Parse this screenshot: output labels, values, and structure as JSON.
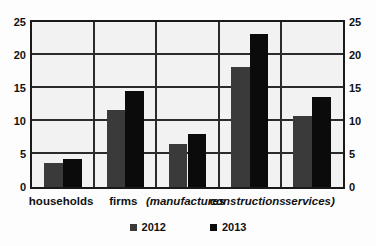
{
  "chart_data": {
    "type": "bar",
    "title": "",
    "subtitle": "",
    "xlabel": "",
    "ylabel": "",
    "ylim": [
      0,
      25
    ],
    "yticks": [
      0,
      5,
      10,
      15,
      20,
      25
    ],
    "grid": true,
    "dual_y_axis": true,
    "legend_position": "bottom",
    "categories": [
      "households",
      "firms",
      "(manufactures",
      "constructions",
      "services)"
    ],
    "series": [
      {
        "name": "2012",
        "color": "#3a3a3a",
        "values": [
          3.6,
          11.7,
          6.5,
          18.2,
          10.7
        ]
      },
      {
        "name": "2013",
        "color": "#0b0b0b",
        "values": [
          4.2,
          14.5,
          8.0,
          23.2,
          13.6
        ]
      }
    ]
  },
  "axes": {
    "left": {
      "name": "left-y-axis",
      "ticks": [
        "25",
        "20",
        "15",
        "10",
        "5",
        "0"
      ]
    },
    "right": {
      "name": "right-y-axis",
      "ticks": [
        "25",
        "20",
        "15",
        "10",
        "5",
        "0"
      ]
    }
  },
  "category_labels": [
    {
      "text": "households",
      "italic": false
    },
    {
      "text": "firms",
      "italic": false
    },
    {
      "text": "(manufactures",
      "italic": true
    },
    {
      "text": "constructions",
      "italic": true
    },
    {
      "text": "services)",
      "italic": true
    }
  ],
  "legend": {
    "entries": [
      {
        "label": "2012",
        "color": "#3a3a3a"
      },
      {
        "label": "2013",
        "color": "#0b0b0b"
      }
    ]
  },
  "colors": {
    "series_2012": "#3a3a3a",
    "series_2013": "#0b0b0b",
    "plot_background": "#f2f2f2",
    "axis_line": "#1a1a1a",
    "grid_line": "#2b2b2b",
    "text": "#111111",
    "page_background": "#fdfdfd"
  }
}
